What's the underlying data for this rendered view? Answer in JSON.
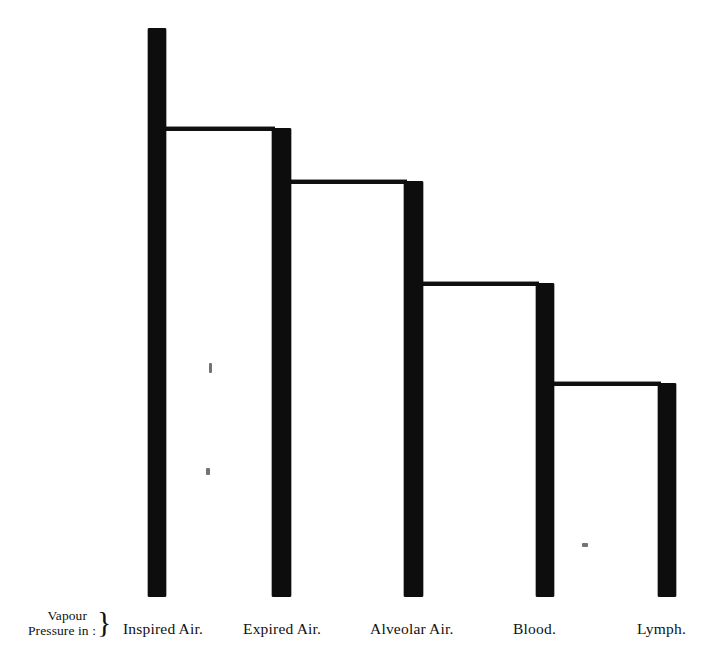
{
  "figure": {
    "title": "",
    "prefix_label": {
      "line1": "Vapour",
      "line2": "Pressure in :",
      "brace": "}"
    }
  },
  "chart_data": {
    "type": "bar",
    "title": "",
    "xlabel": "",
    "ylabel": "Vapour Pressure in :",
    "categories": [
      "Inspired Air.",
      "Expired Air.",
      "Alveolar Air.",
      "Blood.",
      "Lymph."
    ],
    "values": [
      100,
      82.5,
      73.2,
      55.3,
      37.7
    ],
    "value_units": "relative vapour pressure (baseline = bar bottom)",
    "ylim": [
      0,
      100
    ],
    "grid": false,
    "legend": null,
    "orientation": "vertical",
    "style": "stepped-outline bars, solid black, descending left to right"
  },
  "bars": [
    {
      "name": "inspired-air",
      "label": "Inspired Air.",
      "left": 148,
      "top": 28,
      "width": 18,
      "bottom": 597,
      "label_left": 123
    },
    {
      "name": "expired-air",
      "label": "Expired Air.",
      "left": 272,
      "top": 128,
      "width": 19,
      "bottom": 597,
      "label_left": 243
    },
    {
      "name": "alveolar-air",
      "label": "Alveolar Air.",
      "left": 404,
      "top": 181,
      "width": 19,
      "bottom": 597,
      "label_left": 370
    },
    {
      "name": "blood",
      "label": "Blood.",
      "left": 536,
      "top": 283,
      "width": 18,
      "bottom": 597,
      "label_left": 513
    },
    {
      "name": "lymph",
      "label": "Lymph.",
      "left": 658,
      "top": 383,
      "width": 18,
      "bottom": 597,
      "label_left": 637
    }
  ],
  "connectors": [
    {
      "name": "connector-inspired-to-expired",
      "left": 163,
      "top": 127,
      "width": 112
    },
    {
      "name": "connector-expired-to-alveolar",
      "left": 288,
      "top": 180,
      "width": 119
    },
    {
      "name": "connector-alveolar-to-blood",
      "left": 420,
      "top": 282,
      "width": 119
    },
    {
      "name": "connector-blood-to-lymph",
      "left": 551,
      "top": 382,
      "width": 110
    }
  ],
  "specks": [
    {
      "name": "scan-speck-upper",
      "left": 209,
      "top": 363,
      "width": 3,
      "height": 10
    },
    {
      "name": "scan-speck-lower",
      "left": 206,
      "top": 468,
      "width": 4,
      "height": 7
    },
    {
      "name": "scan-speck-right",
      "left": 582,
      "top": 543,
      "width": 6,
      "height": 4
    }
  ],
  "colors": {
    "ink": "#0d0d0d",
    "paper": "#ffffff",
    "speck": "#5a5a5a"
  }
}
